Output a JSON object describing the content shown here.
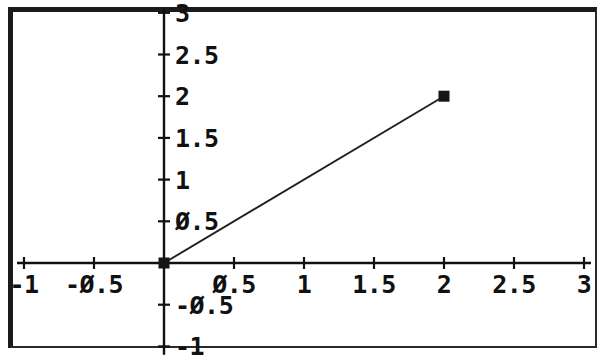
{
  "chart_data": {
    "type": "line",
    "title": "",
    "xlabel": "",
    "ylabel": "",
    "xlim": [
      -1.05,
      3.05
    ],
    "ylim": [
      -1.1,
      3.05
    ],
    "grid": false,
    "legend": null,
    "axis_color": "#111111",
    "line_color": "#1f1f1f",
    "marker_color": "#151515",
    "background_color": "#ffffff",
    "border_color": "#1b1b1b",
    "marker_style": "filled-square",
    "xticks": [
      -1,
      -0.5,
      0,
      0.5,
      1,
      1.5,
      2,
      2.5,
      3
    ],
    "xtick_labels": [
      "-1",
      "-0.5",
      "",
      "0.5",
      "1",
      "1.5",
      "2",
      "2.5",
      "3"
    ],
    "yticks": [
      -1,
      -0.5,
      0,
      0.5,
      1,
      1.5,
      2,
      2.5,
      3
    ],
    "ytick_labels": [
      "-1",
      "-0.5",
      "",
      "0.5",
      "1",
      "1.5",
      "2",
      "2.5",
      "3"
    ],
    "series": [
      {
        "name": "segment",
        "x": [
          0,
          2
        ],
        "y": [
          0,
          2
        ],
        "markers": [
          {
            "x": 0,
            "y": 0
          },
          {
            "x": 2,
            "y": 2
          }
        ]
      }
    ]
  }
}
